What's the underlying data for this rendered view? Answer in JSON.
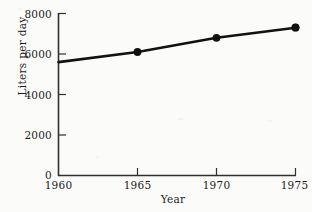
{
  "chart_data": {
    "type": "line",
    "title": "",
    "xlabel": "Year",
    "ylabel": "Liters per day",
    "x": [
      1960,
      1965,
      1970,
      1975
    ],
    "values": [
      5600,
      6100,
      6800,
      7300
    ],
    "xlim": [
      1960,
      1975
    ],
    "ylim": [
      0,
      8000
    ],
    "xticks": [
      1960,
      1965,
      1970,
      1975
    ],
    "yticks": [
      0,
      2000,
      4000,
      6000,
      8000
    ],
    "xtick_labels": [
      "1960",
      "1965",
      "1970",
      "1975"
    ],
    "ytick_labels": [
      "0",
      "2000",
      "4000",
      "6000",
      "8000"
    ],
    "grid": false,
    "legend": false,
    "legend_position": "none",
    "marker": "filled-circle",
    "line_color": "#111111",
    "marker_color": "#111111",
    "background_color": "#fbfbfa",
    "axis_color": "#3a3a3a"
  },
  "axis_titles": {
    "y": "Liters per day",
    "x": "Year"
  }
}
